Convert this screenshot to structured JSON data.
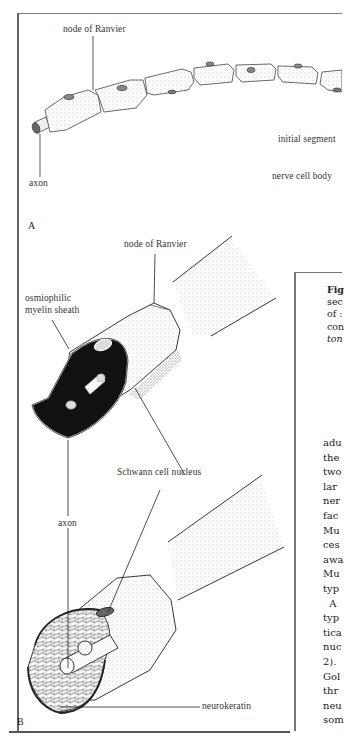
{
  "figure": {
    "panel_a": {
      "letter": "A",
      "labels": {
        "node_of_ranvier": "node of Ranvier",
        "axon": "axon",
        "initial_segment": "initial segment",
        "nerve_cell_body": "nerve cell body"
      }
    },
    "panel_b": {
      "letter": "B",
      "labels": {
        "node_of_ranvier": "node of Ranvier",
        "myelin_sheath_line1": "osmiophilic",
        "myelin_sheath_line2": "myelin sheath",
        "schwann_cell_nucleus": "Schwann cell nucleus",
        "axon": "axon",
        "neurokeratin": "neurokeratin"
      }
    }
  },
  "caption_fragments": {
    "lines": [
      "Fig",
      "sec",
      "of :",
      "con",
      "ton"
    ]
  },
  "body_text_fragments": {
    "lines": [
      "adu",
      "the",
      "two",
      "lar",
      "ner",
      "fac",
      "Mu",
      "ces",
      "awa",
      "Mu",
      "typ",
      "  A",
      "typ",
      "tica",
      "nuc",
      "2).",
      "Gol",
      "thr",
      "neu",
      "som"
    ]
  }
}
